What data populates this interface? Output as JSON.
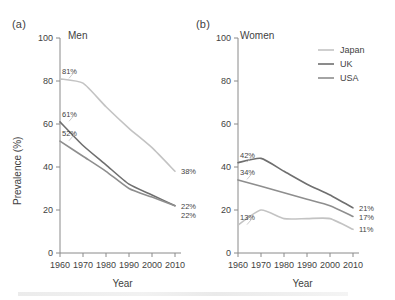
{
  "figure": {
    "panels": [
      {
        "letter": "(a)",
        "title": "Men",
        "xlabel": "Year",
        "ylabel": "Prevalence (%)"
      },
      {
        "letter": "(b)",
        "title": "Women",
        "xlabel": "Year",
        "ylabel": "Prevalence (%)"
      }
    ],
    "legend": {
      "position": "top-right-of-panel-b",
      "entries": [
        {
          "label": "Japan",
          "color": "#c3c3c3"
        },
        {
          "label": "UK",
          "color": "#6f6f6f"
        },
        {
          "label": "USA",
          "color": "#8e8e8e"
        }
      ]
    },
    "axis": {
      "y_ticks": [
        "0",
        "20",
        "40",
        "60",
        "80",
        "100"
      ],
      "x_ticks": [
        "1960",
        "1970",
        "1980",
        "1990",
        "2000",
        "2010"
      ]
    }
  },
  "chart_data": [
    {
      "type": "line",
      "panel": "(a)",
      "title": "Men",
      "xlabel": "Year",
      "ylabel": "Prevalence (%)",
      "xlim": [
        1960,
        2010
      ],
      "ylim": [
        0,
        100
      ],
      "x": [
        1960,
        1970,
        1980,
        1990,
        2000,
        2010
      ],
      "grid": false,
      "legend": "panel-b",
      "series": [
        {
          "name": "Japan",
          "color": "#c3c3c3",
          "values": [
            81,
            79,
            68,
            58,
            49,
            38
          ],
          "start_label": "81%",
          "end_label": "38%"
        },
        {
          "name": "UK",
          "color": "#6f6f6f",
          "values": [
            61,
            50,
            41,
            32,
            27,
            22
          ],
          "start_label": "61%",
          "end_label": "22%"
        },
        {
          "name": "USA",
          "color": "#8e8e8e",
          "values": [
            52,
            45,
            38,
            30,
            26,
            22
          ],
          "start_label": "52%",
          "end_label": "22%"
        }
      ]
    },
    {
      "type": "line",
      "panel": "(b)",
      "title": "Women",
      "xlabel": "Year",
      "ylabel": "Prevalence (%)",
      "xlim": [
        1960,
        2010
      ],
      "ylim": [
        0,
        100
      ],
      "x": [
        1960,
        1970,
        1980,
        1990,
        2000,
        2010
      ],
      "grid": false,
      "legend": "panel-b",
      "series": [
        {
          "name": "UK",
          "color": "#6f6f6f",
          "values": [
            42,
            44,
            38,
            32,
            27,
            21
          ],
          "start_label": "42%",
          "end_label": "21%"
        },
        {
          "name": "USA",
          "color": "#8e8e8e",
          "values": [
            34,
            31,
            28,
            25,
            22,
            17
          ],
          "start_label": "34%",
          "end_label": "17%"
        },
        {
          "name": "Japan",
          "color": "#c3c3c3",
          "values": [
            13,
            20,
            16,
            16,
            16,
            11
          ],
          "start_label": "13%",
          "end_label": "11%"
        }
      ]
    }
  ]
}
